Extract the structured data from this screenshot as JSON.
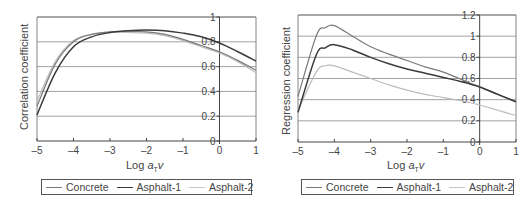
{
  "chart_data": [
    {
      "type": "line",
      "title": "",
      "xlabel": "Log aTv",
      "ylabel": "Correlation coefficient",
      "xlim": [
        -5,
        1
      ],
      "ylim": [
        0,
        1
      ],
      "xticks": [
        -5,
        -4,
        -3,
        -2,
        -1,
        0,
        1
      ],
      "yticks": [
        0,
        0.2,
        0.4,
        0.6,
        0.8,
        1
      ],
      "grid": "horizontal",
      "legend_position": "bottom",
      "x": [
        -5,
        -4.5,
        -4,
        -3.5,
        -3,
        -2.5,
        -2,
        -1.5,
        -1,
        -0.5,
        0,
        0.5,
        1
      ],
      "series": [
        {
          "name": "Concrete",
          "color": "#7a7a7a",
          "values": [
            0.28,
            0.62,
            0.8,
            0.86,
            0.88,
            0.885,
            0.88,
            0.86,
            0.82,
            0.77,
            0.72,
            0.65,
            0.57
          ]
        },
        {
          "name": "Asphalt-1",
          "color": "#3a3a3a",
          "values": [
            0.21,
            0.55,
            0.76,
            0.84,
            0.875,
            0.89,
            0.895,
            0.89,
            0.87,
            0.84,
            0.79,
            0.72,
            0.645
          ]
        },
        {
          "name": "Asphalt-2",
          "color": "#bdbdbd",
          "values": [
            0.32,
            0.64,
            0.81,
            0.86,
            0.875,
            0.875,
            0.87,
            0.85,
            0.81,
            0.76,
            0.71,
            0.64,
            0.55
          ]
        }
      ]
    },
    {
      "type": "line",
      "title": "",
      "xlabel": "Log aTv",
      "ylabel": "Regression coefficient",
      "xlim": [
        -5,
        1
      ],
      "ylim": [
        0,
        1.2
      ],
      "xticks": [
        -5,
        -4,
        -3,
        -2,
        -1,
        0,
        1
      ],
      "yticks": [
        0,
        0.2,
        0.4,
        0.6,
        0.8,
        1,
        1.2
      ],
      "grid": "horizontal",
      "legend_position": "bottom",
      "x": [
        -5,
        -4.5,
        -4.25,
        -4,
        -3.5,
        -3,
        -2.5,
        -2,
        -1.5,
        -1,
        -0.5,
        0,
        0.5,
        1
      ],
      "series": [
        {
          "name": "Concrete",
          "color": "#7a7a7a",
          "values": [
            0.43,
            1.0,
            1.08,
            1.1,
            1.0,
            0.9,
            0.83,
            0.77,
            0.71,
            0.66,
            0.59,
            0.52,
            0.45,
            0.38
          ]
        },
        {
          "name": "Asphalt-1",
          "color": "#3a3a3a",
          "values": [
            0.28,
            0.82,
            0.89,
            0.92,
            0.87,
            0.8,
            0.74,
            0.69,
            0.65,
            0.61,
            0.57,
            0.52,
            0.45,
            0.38
          ]
        },
        {
          "name": "Asphalt-2",
          "color": "#bdbdbd",
          "values": [
            0.3,
            0.66,
            0.72,
            0.72,
            0.66,
            0.6,
            0.54,
            0.49,
            0.45,
            0.42,
            0.39,
            0.35,
            0.3,
            0.25
          ]
        }
      ]
    }
  ],
  "left": {
    "ylabel": "Correlation coefficient",
    "xlabel_prefix": "Log ",
    "xlabel_var": "a",
    "xlabel_sub": "T",
    "xlabel_suffix": "v",
    "legend": [
      "Concrete",
      "Asphalt-1",
      "Asphalt-2"
    ]
  },
  "right": {
    "ylabel": "Regression coefficient",
    "xlabel_prefix": "Log ",
    "xlabel_var": "a",
    "xlabel_sub": "T",
    "xlabel_suffix": "v",
    "legend": [
      "Concrete",
      "Asphalt-1",
      "Asphalt-2"
    ]
  }
}
